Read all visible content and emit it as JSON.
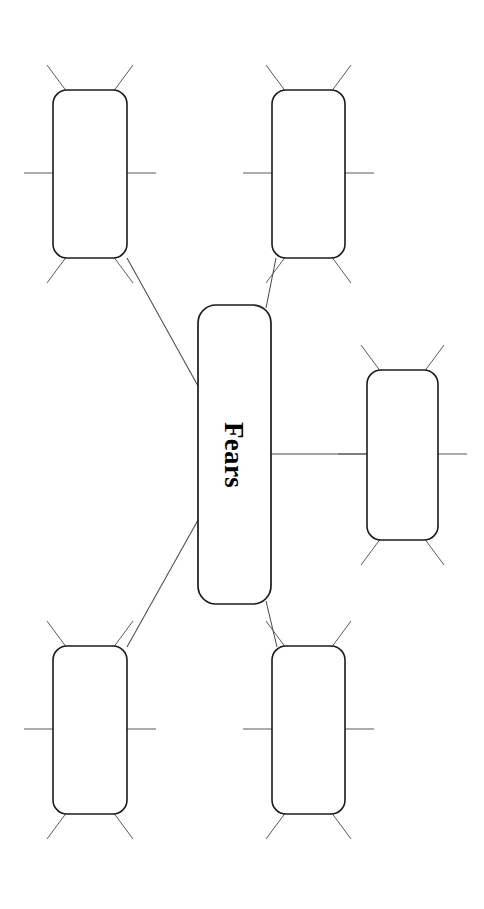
{
  "page": {
    "title": "Fears",
    "type": "graphic-organizer",
    "orientation": "rotated-90",
    "background_color": "#ffffff"
  },
  "center": {
    "label": "Fears",
    "text_rotation_deg": 90,
    "box": {
      "x": 198,
      "y": 305,
      "width": 73,
      "height": 299,
      "radius": 18
    },
    "border_color": "#1b1b1b",
    "fill_color": "#ffffff"
  },
  "colors": {
    "box_stroke": "#1b1b1b",
    "ray_stroke": "#5a5a5a",
    "connector_stroke": "#4a4a4a",
    "text": "#000000",
    "background": "#ffffff"
  },
  "branches": [
    {
      "id": "branch-top-left",
      "label": "",
      "position": "top-left",
      "box": {
        "x": 53,
        "y": 90,
        "width": 74,
        "height": 168,
        "radius": 14
      },
      "ray_count": 6,
      "connector": {
        "x1": 127,
        "y1": 258,
        "x2": 198,
        "y2": 386
      }
    },
    {
      "id": "branch-top-right",
      "label": "",
      "position": "top-right",
      "box": {
        "x": 272,
        "y": 90,
        "width": 73,
        "height": 168,
        "radius": 14
      },
      "ray_count": 6,
      "connector": {
        "x1": 276,
        "y1": 258,
        "x2": 266,
        "y2": 308
      }
    },
    {
      "id": "branch-right-middle",
      "label": "",
      "position": "right-middle",
      "box": {
        "x": 367,
        "y": 370,
        "width": 71,
        "height": 170,
        "radius": 14
      },
      "ray_count": 6,
      "connector": {
        "x1": 271,
        "y1": 454,
        "x2": 367,
        "y2": 454
      }
    },
    {
      "id": "branch-bottom-left",
      "label": "",
      "position": "bottom-left",
      "box": {
        "x": 53,
        "y": 646,
        "width": 74,
        "height": 168,
        "radius": 14
      },
      "ray_count": 6,
      "connector": {
        "x1": 198,
        "y1": 520,
        "x2": 127,
        "y2": 647
      }
    },
    {
      "id": "branch-bottom-right",
      "label": "",
      "position": "bottom-right",
      "box": {
        "x": 272,
        "y": 646,
        "width": 73,
        "height": 168,
        "radius": 14
      },
      "ray_count": 6,
      "connector": {
        "x1": 266,
        "y1": 601,
        "x2": 277,
        "y2": 647
      }
    }
  ],
  "ray_geometry": {
    "horizontal_length": 29,
    "diagonal_dx": 20,
    "diagonal_dy": 27,
    "description": "six write-on lines per box: two upper diagonals, two horizontal at mid-height, two lower diagonals"
  }
}
